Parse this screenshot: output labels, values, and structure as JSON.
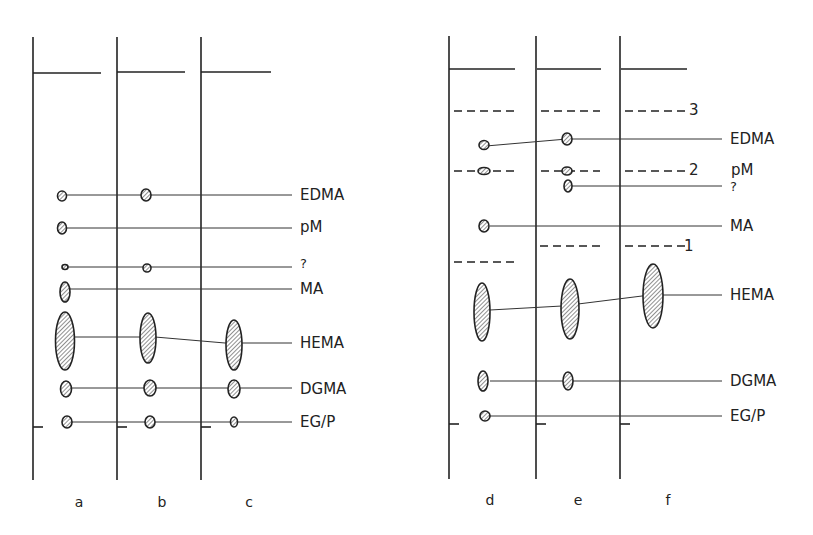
{
  "figure": {
    "type": "thin-layer chromatogram schematic",
    "left_panel": {
      "lanes": [
        "a",
        "b",
        "c"
      ],
      "compounds": [
        "EDMA",
        "pM",
        "?",
        "MA",
        "HEMA",
        "DGMA",
        "EG/P"
      ]
    },
    "right_panel": {
      "lanes": [
        "d",
        "e",
        "f"
      ],
      "compounds": [
        "EDMA",
        "pM",
        "?",
        "MA",
        "HEMA",
        "DGMA",
        "EG/P"
      ],
      "front_markers": [
        "3",
        "2",
        "1"
      ]
    }
  },
  "labels": {
    "left": {
      "edma": "EDMA",
      "pm": "pM",
      "unknown": "?",
      "ma": "MA",
      "hema": "HEMA",
      "dgma": "DGMA",
      "egp": "EG/P"
    },
    "right": {
      "edma": "EDMA",
      "pm": "pM",
      "unknown": "?",
      "ma": "MA",
      "hema": "HEMA",
      "dgma": "DGMA",
      "egp": "EG/P"
    },
    "markers": {
      "m3": "3",
      "m2": "2",
      "m1": "1"
    },
    "lanes": {
      "a": "a",
      "b": "b",
      "c": "c",
      "d": "d",
      "e": "e",
      "f": "f"
    }
  }
}
